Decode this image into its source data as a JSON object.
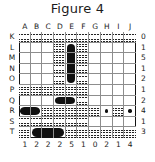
{
  "figure": {
    "title": "Figure 4",
    "type": "battleship-puzzle-grid"
  },
  "grid": {
    "rows": 10,
    "columns": 10,
    "column_labels": [
      "A",
      "B",
      "C",
      "D",
      "E",
      "F",
      "G",
      "H",
      "I",
      "J"
    ],
    "row_labels": [
      "K",
      "L",
      "M",
      "N",
      "O",
      "P",
      "Q",
      "R",
      "S",
      "T"
    ],
    "column_clues": [
      1,
      2,
      2,
      2,
      5,
      1,
      0,
      2,
      1,
      4
    ],
    "row_clues": [
      0,
      1,
      5,
      1,
      2,
      1,
      2,
      4,
      1,
      3
    ],
    "legend": {
      "water": "wavy-hatched cell",
      "ship": "solid black cell",
      "submarine": "small black dot"
    },
    "cells": [
      [
        "water",
        "water",
        "water",
        "water",
        "water",
        "water",
        "water",
        "water",
        "water",
        "water"
      ],
      [
        "empty",
        "empty",
        "empty",
        "water",
        "ship-top",
        "water",
        "empty",
        "empty",
        "empty",
        "empty"
      ],
      [
        "empty",
        "empty",
        "empty",
        "water",
        "ship-mid-v",
        "water",
        "empty",
        "empty",
        "empty",
        "empty"
      ],
      [
        "empty",
        "empty",
        "empty",
        "water",
        "ship-mid-v",
        "water",
        "empty",
        "empty",
        "empty",
        "empty"
      ],
      [
        "empty",
        "empty",
        "empty",
        "water",
        "ship-bottom",
        "water",
        "empty",
        "empty",
        "empty",
        "empty"
      ],
      [
        "water",
        "water",
        "water",
        "water",
        "water",
        "water",
        "empty",
        "empty",
        "empty",
        "empty"
      ],
      [
        "empty",
        "empty",
        "empty",
        "ship-left",
        "ship-right",
        "water",
        "empty",
        "empty",
        "empty",
        "empty"
      ],
      [
        "ship-left",
        "ship-right",
        "water",
        "water",
        "water",
        "water",
        "water",
        "sub",
        "water",
        "sub"
      ],
      [
        "water",
        "water",
        "water",
        "water",
        "water",
        "water",
        "empty",
        "empty",
        "empty",
        "empty"
      ],
      [
        "water",
        "ship-left",
        "ship-mid-h",
        "ship-right",
        "water",
        "water",
        "water",
        "water",
        "water",
        "water"
      ]
    ]
  },
  "colors": {
    "ship": "#101010",
    "grid_line": "#8d8d8d",
    "border": "#111111",
    "text": "#1b1b1b",
    "background": "#ffffff"
  }
}
